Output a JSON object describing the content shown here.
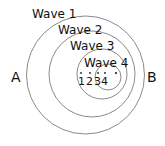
{
  "diagram": {
    "waves": [
      {
        "label": "Wave 1",
        "cx": 85.5,
        "cy": 75,
        "r": 59,
        "label_x": 32,
        "label_y": 18
      },
      {
        "label": "Wave 2",
        "cx": 92,
        "cy": 74,
        "r": 43,
        "label_x": 58,
        "label_y": 34
      },
      {
        "label": "Wave 3",
        "cx": 102,
        "cy": 74,
        "r": 25,
        "label_x": 70,
        "label_y": 50
      },
      {
        "label": "Wave 4",
        "cx": 108,
        "cy": 77,
        "r": 13,
        "label_x": 84,
        "label_y": 66
      }
    ],
    "side_labels": {
      "left": "A",
      "right": "B"
    },
    "positions": [
      "1",
      "2",
      "3",
      "4"
    ],
    "stroke_color": "#8a8a8a",
    "text_color": "#111111"
  }
}
